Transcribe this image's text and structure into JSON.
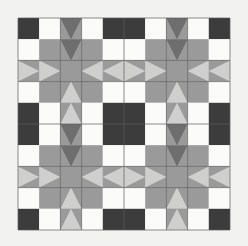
{
  "artwork": {
    "title": "Quilt Block Pattern",
    "kind": "geometric-quilt-tiling",
    "canvas": {
      "width": 248,
      "height": 246
    },
    "background_color": "#f2f2f0",
    "grid": {
      "cell_size": 21.2,
      "origin_x": 18,
      "origin_y": 18,
      "columns": 10,
      "rows": 10,
      "blocks_across": 2,
      "blocks_down": 2,
      "block_cells": 5
    },
    "seam_line": {
      "color": "#5c5c5c",
      "width": 0.7
    },
    "palette": {
      "dark": "#3c3c3c",
      "medium_dark": "#6e6e6e",
      "medium": "#9a9a9a",
      "light": "#cfcfcd",
      "white": "#fbfbf9"
    },
    "palette_labels": [
      "dark charcoal",
      "medium dark gray",
      "medium gray",
      "light gray",
      "off white"
    ],
    "block_description": "sawtooth star block, 5x5 cells, dark corner squares, white edge squares, chevron flying-geese on block edges, large medium-gray center square",
    "block_cell_map": [
      [
        "dark",
        "white",
        "geese-down",
        "white",
        "dark"
      ],
      [
        "white",
        "medium",
        "geese-down",
        "medium",
        "white"
      ],
      [
        "geese-right",
        "geese-right",
        "medium",
        "geese-left",
        "geese-left"
      ],
      [
        "white",
        "medium",
        "geese-up",
        "medium",
        "white"
      ],
      [
        "dark",
        "white",
        "geese-up",
        "white",
        "dark"
      ]
    ]
  }
}
